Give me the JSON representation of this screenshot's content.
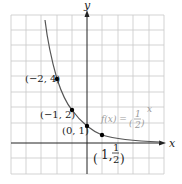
{
  "diagram": {
    "type": "function-graph",
    "axes": {
      "x_label": "x",
      "y_label": "y"
    },
    "function_label": {
      "lhs": "f(x) =",
      "base_num": "1",
      "base_den": "2",
      "exponent": "x"
    },
    "points": [
      {
        "label": "(−2, 4)",
        "x": -2,
        "y": 4
      },
      {
        "label": "(−1, 2)",
        "x": -1,
        "y": 2
      },
      {
        "label": "(0, 1)",
        "x": 0,
        "y": 1
      },
      {
        "label_prefix": "1,",
        "label_num": "1",
        "label_den": "2",
        "x": 1,
        "y": 0.5
      }
    ],
    "colors": {
      "grid": "#c8c8c8",
      "curve": "#555555",
      "axis": "#222222",
      "point": "#000000"
    }
  }
}
